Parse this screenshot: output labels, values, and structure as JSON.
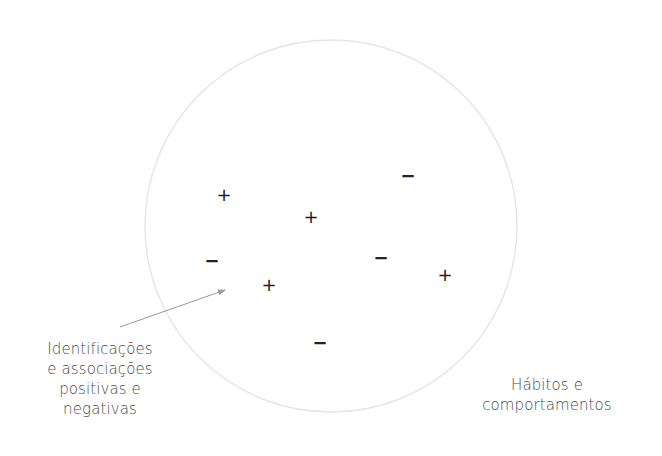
{
  "diagram": {
    "circle": {
      "cx": 331,
      "cy": 226,
      "r": 186,
      "stroke": "#e6e6e6"
    },
    "signs": [
      {
        "symbol": "+",
        "type": "plus",
        "x": 224,
        "y": 195
      },
      {
        "symbol": "+",
        "type": "plus",
        "x": 311,
        "y": 217
      },
      {
        "symbol": "−",
        "type": "minus",
        "x": 408,
        "y": 176
      },
      {
        "symbol": "−",
        "type": "minus",
        "x": 212,
        "y": 261
      },
      {
        "symbol": "−",
        "type": "minus",
        "x": 381,
        "y": 258
      },
      {
        "symbol": "+",
        "type": "plus",
        "x": 269,
        "y": 285
      },
      {
        "symbol": "+",
        "type": "plus",
        "x": 445,
        "y": 275
      },
      {
        "symbol": "−",
        "type": "minus",
        "x": 320,
        "y": 343
      }
    ],
    "arrow": {
      "x1": 120,
      "y1": 327,
      "x2": 225,
      "y2": 290,
      "color": "#9a9a9a"
    },
    "labels": {
      "left": {
        "lines": [
          "Identificações",
          "e associações",
          "positivas e",
          "negativas"
        ]
      },
      "right": {
        "lines": [
          "Hábitos e",
          "comportamentos"
        ]
      }
    },
    "colors": {
      "background": "#ffffff",
      "text": "#4a4a4a",
      "signs": "#222222"
    }
  }
}
